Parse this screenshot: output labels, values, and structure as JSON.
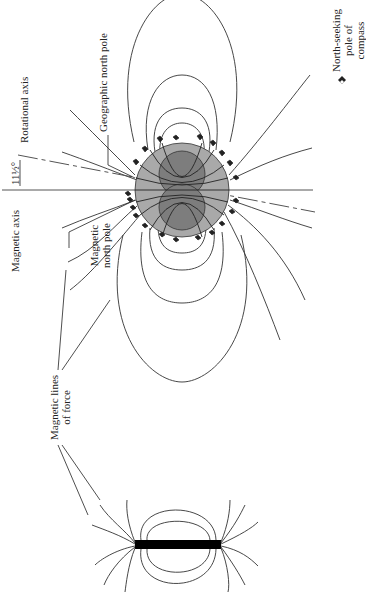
{
  "figure": {
    "orientation": "rotated -90deg",
    "labels": {
      "rotational_axis": "Rotational axis",
      "angle": "11½°",
      "magnetic_axis": "Magnetic axis",
      "geographic_north_pole": "Geographic north pole",
      "magnetic_north_pole_line1": "Magnetic",
      "magnetic_north_pole_line2": "north pole",
      "lines_of_force_line1": "Magnetic lines",
      "lines_of_force_line2": "of force",
      "legend_line1": "North-seeking",
      "legend_line2": "pole of",
      "legend_line3": "compass"
    },
    "colors": {
      "globe_fill": "#a9a9a9",
      "globe_core_fill": "#7d7d7d",
      "line": "#333333",
      "magnet": "#000000"
    },
    "elements": [
      "earth-globe",
      "earth-core-lobes",
      "magnetic-field-lines",
      "compass-needles",
      "magnetic-axis-line",
      "rotational-axis-dashed-line",
      "bar-magnet",
      "bar-magnet-field-lines"
    ]
  }
}
